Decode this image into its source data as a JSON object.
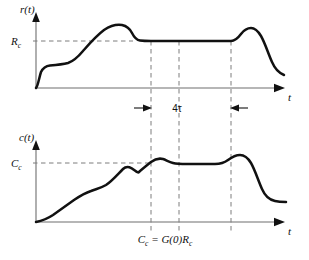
{
  "figure": {
    "background": "#ffffff",
    "curve_color": "#111111",
    "axis_color": "#6e6e6e",
    "dash_color": "#7d7d7d"
  },
  "top_plot": {
    "y_axis_label": "r(t)",
    "level_label_main": "R",
    "level_label_sub": "c",
    "x_axis_label": "t",
    "curve_path": "M 36,88 C 38,86 39,78 41,72 C 43,68 46,66 50,65.5 C 56,65 62,64.5 68,63 C 74,61 78,57 83,51 C 90,43 96,36 104,30 C 110,26 116,24 122,25 C 127,26 130,29 132,33 C 134,37 136,40 140,40.5 C 144,41 148,41 151,41 L 231,41 C 235,41 238,38 241,34 C 244,30 247,28 251,28 C 255,28 258,31 261,36 C 265,43 268,53 272,62 C 275,69 279,73 284,75",
    "level_line": {
      "y": 41,
      "x_start": 33,
      "x_end": 133
    },
    "dash_verticals": [
      151,
      179,
      231
    ]
  },
  "dimension": {
    "label": "4τ",
    "y": 108,
    "left_x": 151,
    "right_x": 231,
    "description": "settling-interval-four-tau"
  },
  "bottom_plot": {
    "y_axis_label": "c(t)",
    "level_label_main": "C",
    "level_label_sub": "c",
    "x_axis_label": "t",
    "equation": "Cₑ = G(0)Rₑ",
    "equation_parts": {
      "lhs_main": "C",
      "lhs_sub": "c",
      "equals": " = ",
      "gain": "G(0)",
      "rhs_main": "R",
      "rhs_sub": "c"
    },
    "curve_path": "M 36,222 C 41,221 47,219 53,215 C 60,210 67,205 74,200 C 80,196 85,193 91,191 C 96,189 101,188 106,185 C 112,181 117,175 123,169 C 130,162 137,175 139,172 C 139,172 139,172 139,172 C 140,171 146,166 151,162 C 155,159 159,158 163,159 C 166,160 169,162 173,163 C 177,164 182,164 187,164 L 215,164 C 220,164 224,163 228,160 C 232,157 236,155 240,155 C 245,155 248,158 251,163 C 255,170 258,180 262,189 C 265,196 270,200 275,201 C 279,202 283,202 286,202",
    "level_line": {
      "y": 163,
      "x_start": 33,
      "x_end": 152
    },
    "dash_verticals": [
      151,
      179,
      231
    ]
  },
  "geometry": {
    "top_axis_y": 88,
    "top_axis_x_start": 36,
    "top_axis_x_end": 283,
    "top_yaxis_x": 36,
    "top_yaxis_y_top": 14,
    "bottom_axis_y": 222,
    "bottom_axis_x_start": 36,
    "bottom_axis_x_end": 283,
    "bottom_yaxis_x": 36,
    "bottom_yaxis_y_top": 142
  }
}
